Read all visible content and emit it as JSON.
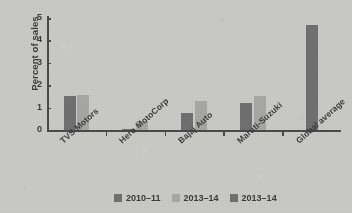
{
  "chart_data": {
    "type": "bar",
    "title": "",
    "subtitle": "",
    "xlabel": "",
    "ylabel": "Percent of sales",
    "ylim": [
      0,
      5
    ],
    "yticks": [
      "0",
      "1",
      "2",
      "3",
      "4",
      "5"
    ],
    "grid": false,
    "legend_position": "bottom",
    "categories": [
      "TVS Motors",
      "Hero MotoCorp",
      "Bajaj Auto",
      "Maruti-Suzuki",
      "Global average"
    ],
    "series": [
      {
        "name": "2010–11",
        "color": "#6f6f6f",
        "values": [
          1.5,
          0.05,
          0.75,
          1.2,
          null
        ]
      },
      {
        "name": "2013–14",
        "color": "#a6a6a4",
        "values": [
          1.55,
          0.4,
          1.3,
          1.5,
          null
        ]
      },
      {
        "name": "2013–14",
        "color": "#6f6f6f",
        "values": [
          null,
          null,
          null,
          null,
          4.7
        ]
      }
    ]
  },
  "colors": {
    "background": "#c9c9c5",
    "axis": "#4a4a4a",
    "text": "#3a3a3a",
    "series_dark": "#6f6f6f",
    "series_light": "#a6a6a4"
  }
}
